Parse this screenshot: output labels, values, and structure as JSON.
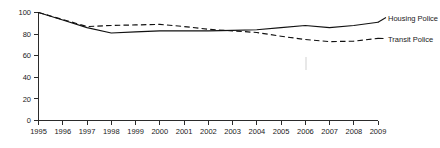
{
  "chart_data": {
    "type": "line",
    "title": "",
    "xlabel": "",
    "ylabel": "",
    "xlim": [
      1995,
      2009
    ],
    "ylim": [
      0,
      100
    ],
    "grid": false,
    "legend_position": "right-inline",
    "x": [
      1995,
      1996,
      1997,
      1998,
      1999,
      2000,
      2001,
      2002,
      2003,
      2004,
      2005,
      2006,
      2007,
      2008,
      2009
    ],
    "x_tick_labels": [
      "1995",
      "1996",
      "1997",
      "1998",
      "1999",
      "2000",
      "2001",
      "2002",
      "2003",
      "2004",
      "2005",
      "2006",
      "2007",
      "2008",
      "2009"
    ],
    "y_tick_labels": [
      "0",
      "20",
      "40",
      "60",
      "80",
      "100"
    ],
    "y_ticks": [
      0,
      20,
      40,
      60,
      80,
      100
    ],
    "series": [
      {
        "name": "Housing Police",
        "style": "solid",
        "color": "#111111",
        "values": [
          100,
          93,
          86,
          81,
          82,
          83,
          83,
          83,
          83.5,
          84,
          86,
          88,
          86,
          88,
          91
        ]
      },
      {
        "name": "Transit Police",
        "style": "dashed",
        "color": "#111111",
        "values": [
          100,
          93.5,
          87,
          88,
          88.5,
          89,
          87,
          84.5,
          83,
          81.5,
          78,
          75,
          73,
          73.5,
          76
        ]
      }
    ]
  },
  "legend": {
    "entries": [
      {
        "label": "Housing Police",
        "style": "solid"
      },
      {
        "label": "Transit Police",
        "style": "dashed"
      }
    ]
  },
  "axes": {
    "y_labels": [
      "100",
      "80",
      "60",
      "40",
      "20",
      "0"
    ],
    "x_labels": [
      "1995",
      "1996",
      "1997",
      "1998",
      "1999",
      "2000",
      "2001",
      "2002",
      "2003",
      "2004",
      "2005",
      "2006",
      "2007",
      "2008",
      "2009"
    ]
  }
}
